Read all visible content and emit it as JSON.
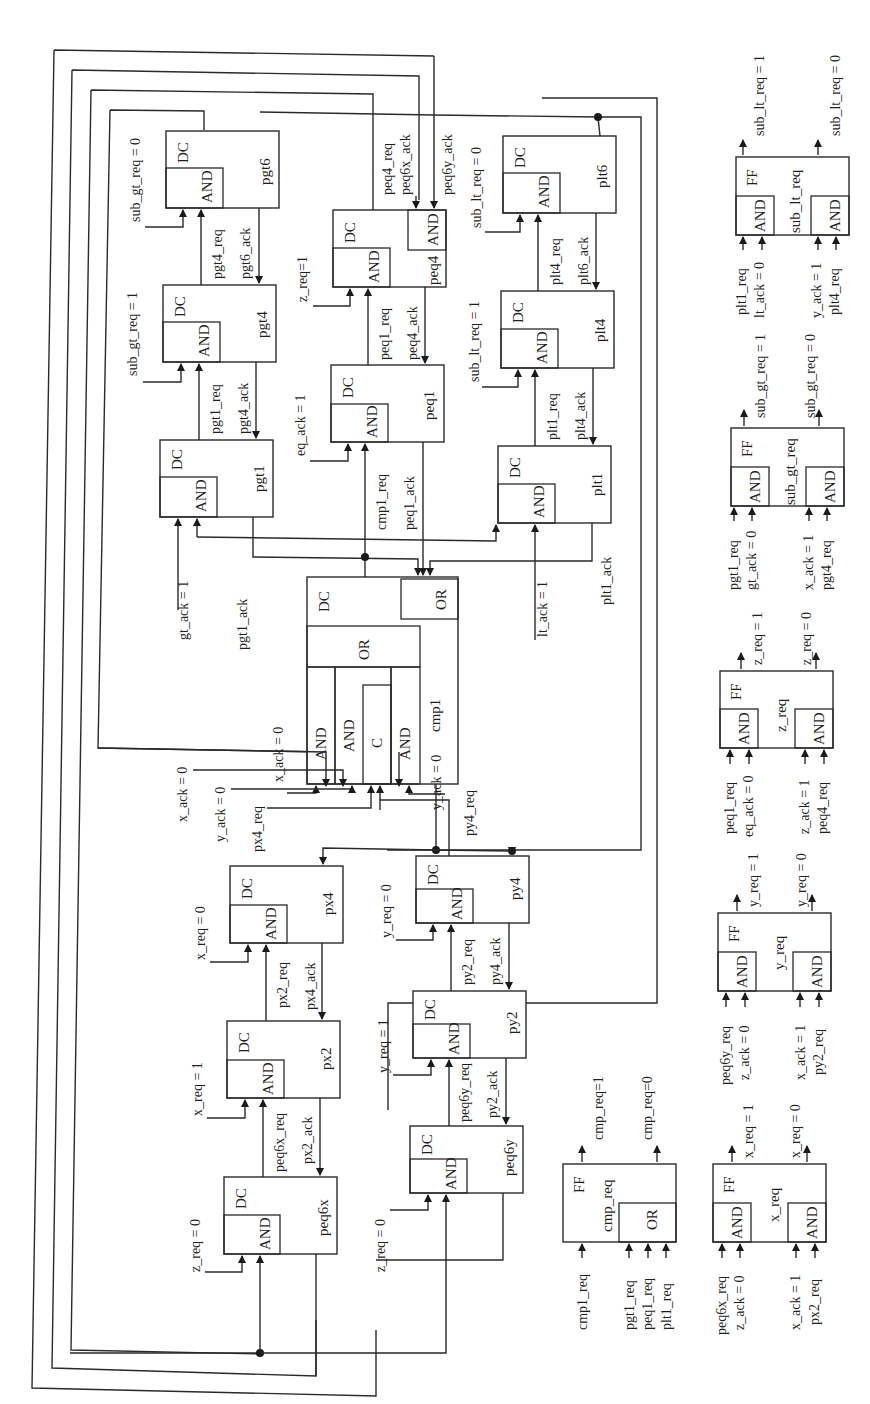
{
  "diagram": {
    "orientation": "rotated-90-ccw",
    "colors": {
      "line": "#2a2a2a",
      "background": "#ffffff"
    }
  },
  "block_types": {
    "dc": "DC",
    "and": "AND",
    "or": "OR",
    "c": "C",
    "ff": "FF"
  },
  "dc_blocks": [
    {
      "id": "pgt6",
      "name": "pgt6"
    },
    {
      "id": "pgt4",
      "name": "pgt4"
    },
    {
      "id": "pgt1",
      "name": "pgt1"
    },
    {
      "id": "peq4",
      "name": "peq4"
    },
    {
      "id": "peq1",
      "name": "peq1"
    },
    {
      "id": "plt6",
      "name": "plt6"
    },
    {
      "id": "plt4",
      "name": "plt4"
    },
    {
      "id": "plt1",
      "name": "plt1"
    },
    {
      "id": "cmp1",
      "name": "cmp1"
    },
    {
      "id": "px4",
      "name": "px4"
    },
    {
      "id": "px2",
      "name": "px2"
    },
    {
      "id": "peq6x",
      "name": "peq6x"
    },
    {
      "id": "py4",
      "name": "py4"
    },
    {
      "id": "py2",
      "name": "py2"
    },
    {
      "id": "peq6y",
      "name": "peq6y"
    }
  ],
  "signals": {
    "sub_gt_req_0": "sub_gt_req = 0",
    "sub_gt_req_1": "sub_gt_req = 1",
    "pgt4_req": "pgt4_req",
    "pgt6_ack": "pgt6_ack",
    "pgt1_req": "pgt1_req",
    "pgt4_ack": "pgt4_ack",
    "gt_ack_1": "gt_ack = 1",
    "pgt1_ack": "pgt1_ack",
    "peq4_req": "peq4_req",
    "peq6x_ack": "peq6x_ack",
    "peq6y_ack": "peq6y_ack",
    "z_req_1": "z_req=1",
    "peq1_req": "peq1_req",
    "peq4_ack": "peq4_ack",
    "eq_ack_1": "eq_ack = 1",
    "cmp1_req": "cmp1_req",
    "peq1_ack": "peq1_ack",
    "sub_lt_req_0": "sub_lt_req = 0",
    "sub_lt_req_1": "sub_lt_req = 1",
    "plt4_req": "plt4_req",
    "plt6_ack": "plt6_ack",
    "plt1_req": "plt1_req",
    "plt4_ack": "plt4_ack",
    "lt_ack_1": "lt_ack = 1",
    "plt1_ack": "plt1_ack",
    "x_ack_0_a": "x_ack = 0",
    "x_ack_0_b": "x_ack = 0",
    "y_ack_0_a": "y_ack = 0",
    "y_ack_0_b": "y_ack = 0",
    "px4_req": "px4_req",
    "py4_req": "py4_req",
    "x_req_0": "x_req = 0",
    "x_req_1": "x_req = 1",
    "px2_req": "px2_req",
    "px4_ack": "px4_ack",
    "peq6x_req": "peq6x_req",
    "px2_ack": "px2_ack",
    "z_req_0_a": "z_req = 0",
    "y_req_0": "y_req = 0",
    "y_req_1": "y_req = 1",
    "py2_req": "py2_req",
    "py4_ack": "py4_ack",
    "peq6y_req": "peq6y_req",
    "py2_ack": "py2_ack",
    "z_req_0_b": "z_req = 0"
  },
  "ff_blocks": [
    {
      "id": "sub_lt_req",
      "name": "sub_lt_req",
      "inputs_a": [
        "plt1_req",
        "lt_ack = 0"
      ],
      "inputs_b": [
        "y_ack = 1",
        "plt4_req"
      ],
      "outputs": [
        "sub_lt_req = 1",
        "sub_lt_req = 0"
      ]
    },
    {
      "id": "sub_gt_req",
      "name": "sub_gt_req",
      "inputs_a": [
        "pgt1_req",
        "gt_ack = 0"
      ],
      "inputs_b": [
        "x_ack = 1",
        "pgt4_req"
      ],
      "outputs": [
        "sub_gt_req = 1",
        "sub_gt_req = 0"
      ]
    },
    {
      "id": "z_req",
      "name": "z_req",
      "inputs_a": [
        "peq1_req",
        "eq_ack = 0"
      ],
      "inputs_b": [
        "z_ack = 1",
        "peq4_req"
      ],
      "outputs": [
        "z_req = 1",
        "z_req = 0"
      ]
    },
    {
      "id": "y_req",
      "name": "y_req",
      "inputs_a": [
        "peq6y_req",
        "z_ack = 0"
      ],
      "inputs_b": [
        "x_ack = 1",
        "py2_req"
      ],
      "outputs": [
        "y_req = 1",
        "y_req = 0"
      ]
    },
    {
      "id": "x_req",
      "name": "x_req",
      "inputs_a": [
        "peq6x_req",
        "z_ack = 0"
      ],
      "inputs_b": [
        "x_ack = 1",
        "px2_req"
      ],
      "outputs": [
        "x_req = 1",
        "x_req = 0"
      ]
    },
    {
      "id": "cmp_req",
      "name": "cmp_req",
      "inputs_a": [
        "cmp1_req"
      ],
      "inputs_b": [
        "pgt1_req",
        "peq1_req",
        "plt1_req"
      ],
      "outputs": [
        "cmp_req=1",
        "cmp_req=0"
      ]
    }
  ]
}
